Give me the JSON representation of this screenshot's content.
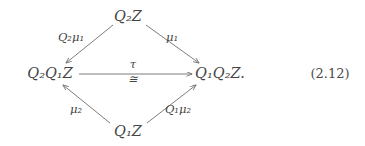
{
  "figure": {
    "kind": "commutative-diagram",
    "equation_number": "(2.12)",
    "nodes": {
      "top": "Q₂Z",
      "left": "Q₂Q₁Z",
      "right": "Q₁Q₂Z.",
      "bottom": "Q₁Z"
    },
    "edge_labels": {
      "top_left": "Q₂μ₁",
      "top_right": "μ₁",
      "bottom_left": "μ₂",
      "bottom_right": "Q₁μ₂",
      "horizontal_above": "τ",
      "horizontal_below": "≅"
    },
    "arrows": [
      {
        "name": "arrow-top-to-left",
        "from": "top",
        "to": "left",
        "label": "Q₂μ₁"
      },
      {
        "name": "arrow-top-to-right",
        "from": "top",
        "to": "right",
        "label": "μ₁"
      },
      {
        "name": "arrow-left-to-right",
        "from": "left",
        "to": "right",
        "label": "τ ≅"
      },
      {
        "name": "arrow-bottom-to-left",
        "from": "bottom",
        "to": "left",
        "label": "μ₂"
      },
      {
        "name": "arrow-bottom-to-right",
        "from": "bottom",
        "to": "right",
        "label": "Q₁μ₂"
      }
    ],
    "colors": {
      "background": "#ffffff",
      "text": "#454545",
      "stroke": "#6e6e6e"
    }
  }
}
